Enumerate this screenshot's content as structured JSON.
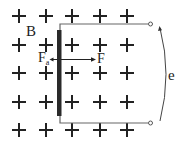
{
  "diagram": {
    "field": {
      "label": "B",
      "direction_symbol": "+",
      "grid": {
        "columns_x": [
          19,
          46,
          72,
          100,
          127
        ],
        "rows_y": [
          16,
          45,
          73,
          102,
          130
        ]
      }
    },
    "rod": {
      "x": 59,
      "y_top": 30,
      "y_bottom": 116,
      "color": "#2a2a2a"
    },
    "rails": {
      "top_y": 24,
      "bottom_y": 123,
      "x_start": 59,
      "x_end": 150,
      "terminal_symbol": "o",
      "color": "#666666"
    },
    "forces": {
      "applied": {
        "label": "F",
        "direction": "right"
      },
      "ampere": {
        "label": "F",
        "subscript": "a",
        "direction": "left"
      }
    },
    "emf": {
      "label": "e"
    }
  }
}
